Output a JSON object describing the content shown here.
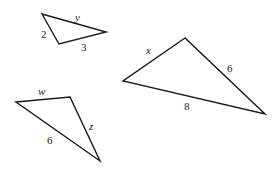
{
  "diagram": {
    "triangles": [
      {
        "id": "triangle-small",
        "vertices": [
          [
            42,
            14
          ],
          [
            106,
            32
          ],
          [
            59,
            44
          ]
        ],
        "labels": [
          {
            "text": "y",
            "x": 75,
            "y": 21,
            "italic": true
          },
          {
            "text": "2",
            "x": 41,
            "y": 38,
            "italic": false
          },
          {
            "text": "3",
            "x": 81,
            "y": 51,
            "italic": false
          }
        ]
      },
      {
        "id": "triangle-large",
        "vertices": [
          [
            185,
            38
          ],
          [
            123,
            81
          ],
          [
            265,
            114
          ]
        ],
        "labels": [
          {
            "text": "x",
            "x": 146,
            "y": 54,
            "italic": true
          },
          {
            "text": "6",
            "x": 227,
            "y": 72,
            "italic": false
          },
          {
            "text": "8",
            "x": 184,
            "y": 110,
            "italic": false
          }
        ]
      },
      {
        "id": "triangle-obtuse",
        "vertices": [
          [
            16,
            102
          ],
          [
            70,
            97
          ],
          [
            100,
            161
          ]
        ],
        "labels": [
          {
            "text": "w",
            "x": 38,
            "y": 95,
            "italic": true
          },
          {
            "text": "z",
            "x": 89,
            "y": 130,
            "italic": true
          },
          {
            "text": "6",
            "x": 47,
            "y": 144,
            "italic": false
          }
        ]
      }
    ],
    "stroke_color": "#1a1a1a",
    "background": "#ffffff"
  }
}
